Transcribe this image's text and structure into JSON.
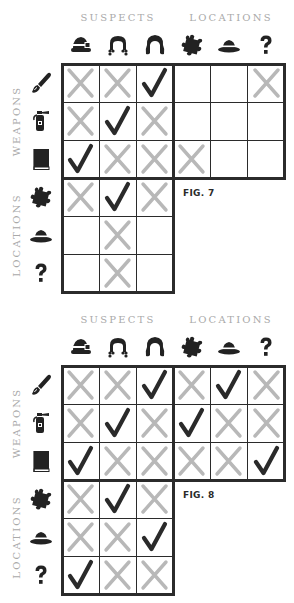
{
  "colors": {
    "grid": "#2b2b2b",
    "cross": "#b8b8b8",
    "check": "#2a2a2a",
    "label": "#a9a9a9"
  },
  "headers": {
    "suspects": "SUSPECTS",
    "locations": "LOCATIONS"
  },
  "side_labels": {
    "weapons": "WEAPONS",
    "locations": "LOCATIONS"
  },
  "columns": [
    {
      "group": "suspects",
      "icon": "bowler-hat-woman-icon"
    },
    {
      "group": "suspects",
      "icon": "curly-hair-icon"
    },
    {
      "group": "suspects",
      "icon": "long-hair-icon"
    },
    {
      "group": "locations",
      "icon": "puzzle-piece-icon"
    },
    {
      "group": "locations",
      "icon": "fedora-hat-icon"
    },
    {
      "group": "locations",
      "icon": "question-mark-icon"
    }
  ],
  "rows": [
    {
      "group": "weapons",
      "icon": "paint-brush-icon"
    },
    {
      "group": "weapons",
      "icon": "fire-extinguisher-icon"
    },
    {
      "group": "weapons",
      "icon": "book-icon"
    },
    {
      "group": "locations",
      "icon": "puzzle-piece-icon"
    },
    {
      "group": "locations",
      "icon": "fedora-hat-icon"
    },
    {
      "group": "locations",
      "icon": "question-mark-icon"
    }
  ],
  "puzzles": [
    {
      "figure": "FIG. 7",
      "grid": [
        [
          "X",
          "X",
          "V",
          "",
          "",
          "X"
        ],
        [
          "X",
          "V",
          "X",
          "",
          "",
          ""
        ],
        [
          "V",
          "X",
          "X",
          "X",
          "",
          ""
        ],
        [
          "X",
          "V",
          "X"
        ],
        [
          "",
          "X",
          ""
        ],
        [
          "",
          "X",
          ""
        ]
      ]
    },
    {
      "figure": "FIG. 8",
      "grid": [
        [
          "X",
          "X",
          "V",
          "X",
          "V",
          "X"
        ],
        [
          "X",
          "V",
          "X",
          "V",
          "X",
          "X"
        ],
        [
          "V",
          "X",
          "X",
          "X",
          "X",
          "V"
        ],
        [
          "X",
          "V",
          "X"
        ],
        [
          "X",
          "X",
          "V"
        ],
        [
          "V",
          "X",
          "X"
        ]
      ]
    }
  ]
}
